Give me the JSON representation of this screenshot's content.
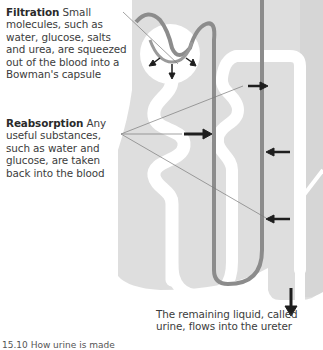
{
  "labels": {
    "filtration": {
      "title": "Filtration",
      "text": "Small molecules, such as water, glucose, salts and urea, are squeezed out of the blood into a Bowman's capsule"
    },
    "reabsorption": {
      "title": "Reabsorption",
      "text": "Any useful substances, such as water and glucose, are taken back into the blood"
    },
    "urine": {
      "text": "The remaining liquid, called urine, flows into the ureter"
    }
  },
  "caption": "15.10  How urine is made",
  "colors": {
    "tissue": "#dcdcdc",
    "tubule": "#ffffff",
    "blood_vessel": "#8c8c8c",
    "arrow": "#1e1e1e",
    "pointer_line": "#7a7a7a"
  },
  "structures": [
    "glomerulus",
    "bowmans-capsule",
    "proximal-tubule",
    "loop-of-henle",
    "distal-tubule",
    "collecting-duct",
    "capillary",
    "ureter-flow"
  ]
}
